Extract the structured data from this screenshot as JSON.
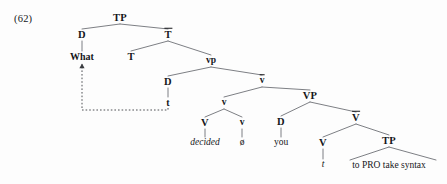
{
  "figure": {
    "example_number": "(62)",
    "type": "syntax-tree",
    "ink_color": "#15161a",
    "background_color": "#fdfdfd",
    "line_color": "#6e7076",
    "movement_line_style": "dashed"
  },
  "nodes": [
    {
      "id": "TP",
      "label": "TP",
      "kind": "category",
      "bar": false,
      "x": 120,
      "y": 18
    },
    {
      "id": "D1",
      "label": "D",
      "kind": "category",
      "bar": false,
      "x": 82,
      "y": 35
    },
    {
      "id": "Tbar",
      "label": "T",
      "kind": "category",
      "bar": true,
      "x": 168,
      "y": 35
    },
    {
      "id": "What",
      "label": "What",
      "kind": "lexical-bold",
      "bar": false,
      "x": 82,
      "y": 57
    },
    {
      "id": "T",
      "label": "T",
      "kind": "category",
      "bar": false,
      "x": 131,
      "y": 57
    },
    {
      "id": "vp",
      "label": "vp",
      "kind": "category-small",
      "bar": false,
      "x": 211,
      "y": 61
    },
    {
      "id": "D2",
      "label": "D",
      "kind": "category",
      "bar": false,
      "x": 168,
      "y": 82
    },
    {
      "id": "vbar",
      "label": "v",
      "kind": "category-small",
      "bar": true,
      "x": 262,
      "y": 81
    },
    {
      "id": "t1",
      "label": "t",
      "kind": "lexical-bold",
      "bar": false,
      "x": 168,
      "y": 103
    },
    {
      "id": "vlittle",
      "label": "v",
      "kind": "category-small",
      "bar": false,
      "x": 224,
      "y": 103
    },
    {
      "id": "VP",
      "label": "VP",
      "kind": "category",
      "bar": false,
      "x": 310,
      "y": 96
    },
    {
      "id": "V1",
      "label": "V",
      "kind": "category",
      "bar": false,
      "x": 205,
      "y": 123
    },
    {
      "id": "v2",
      "label": "v",
      "kind": "category-small",
      "bar": false,
      "x": 242,
      "y": 123
    },
    {
      "id": "D3",
      "label": "D",
      "kind": "category",
      "bar": false,
      "x": 281,
      "y": 122
    },
    {
      "id": "Vbar",
      "label": "V",
      "kind": "category",
      "bar": true,
      "x": 356,
      "y": 118
    },
    {
      "id": "decided",
      "label": "decided",
      "kind": "italic",
      "bar": false,
      "x": 205,
      "y": 143
    },
    {
      "id": "null",
      "label": "ø",
      "kind": "lexical",
      "bar": false,
      "x": 242,
      "y": 143
    },
    {
      "id": "you",
      "label": "you",
      "kind": "lexical",
      "bar": false,
      "x": 281,
      "y": 143
    },
    {
      "id": "V2",
      "label": "V",
      "kind": "category",
      "bar": false,
      "x": 323,
      "y": 143
    },
    {
      "id": "TP2",
      "label": "TP",
      "kind": "category",
      "bar": false,
      "x": 389,
      "y": 141
    },
    {
      "id": "t2",
      "label": "t",
      "kind": "italic",
      "bar": false,
      "x": 323,
      "y": 165
    },
    {
      "id": "embedded",
      "label": "to PRO take syntax",
      "kind": "phrase",
      "bar": false,
      "x": 389,
      "y": 166
    }
  ],
  "branches": [
    {
      "from": "TP",
      "to": "D1"
    },
    {
      "from": "TP",
      "to": "Tbar"
    },
    {
      "from": "D1",
      "to": "What"
    },
    {
      "from": "Tbar",
      "to": "T"
    },
    {
      "from": "Tbar",
      "to": "vp"
    },
    {
      "from": "vp",
      "to": "D2"
    },
    {
      "from": "vp",
      "to": "vbar"
    },
    {
      "from": "D2",
      "to": "t1"
    },
    {
      "from": "vbar",
      "to": "vlittle"
    },
    {
      "from": "vbar",
      "to": "VP"
    },
    {
      "from": "vlittle",
      "to": "V1"
    },
    {
      "from": "vlittle",
      "to": "v2"
    },
    {
      "from": "V1",
      "to": "decided"
    },
    {
      "from": "v2",
      "to": "null"
    },
    {
      "from": "VP",
      "to": "D3"
    },
    {
      "from": "VP",
      "to": "Vbar"
    },
    {
      "from": "D3",
      "to": "you"
    },
    {
      "from": "Vbar",
      "to": "V2"
    },
    {
      "from": "Vbar",
      "to": "TP2"
    },
    {
      "from": "V2",
      "to": "t2"
    }
  ],
  "triangles": [
    {
      "apex": "TP2",
      "left_x": 350,
      "right_x": 436,
      "base_y": 160
    }
  ],
  "movement": {
    "label": "wh-movement",
    "from_node": "t1",
    "to_node": "What",
    "arrowhead": "up",
    "style": "dashed"
  }
}
